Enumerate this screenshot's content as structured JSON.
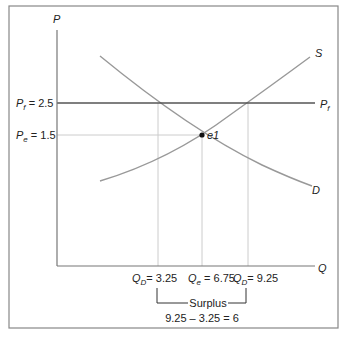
{
  "diagram": {
    "type": "supply-demand-price-floor",
    "axes": {
      "y_label": "P",
      "x_label": "Q"
    },
    "price_lines": {
      "floor": {
        "symbol": "P",
        "subscript": "f",
        "value": "2.5",
        "end_label_symbol": "P",
        "end_label_subscript": "f"
      },
      "equilibrium": {
        "symbol": "P",
        "subscript": "e",
        "value": "1.5"
      }
    },
    "curves": {
      "supply": {
        "label": "S"
      },
      "demand": {
        "label": "D"
      }
    },
    "equilibrium_point": {
      "label": "e1"
    },
    "quantity_labels": [
      {
        "symbol": "Q",
        "subscript": "D",
        "value": "3.25"
      },
      {
        "symbol": "Q",
        "subscript": "e",
        "value": "6.75"
      },
      {
        "symbol": "Q",
        "subscript": "D",
        "value": "9.25"
      }
    ],
    "surplus": {
      "label": "Surplus",
      "calculation": "9.25 – 3.25 = 6"
    },
    "colors": {
      "frame": "#888888",
      "axis": "#777777",
      "floor_line": "#555555",
      "curve": "#999999",
      "guide": "#cccccc",
      "point": "#111111"
    }
  }
}
